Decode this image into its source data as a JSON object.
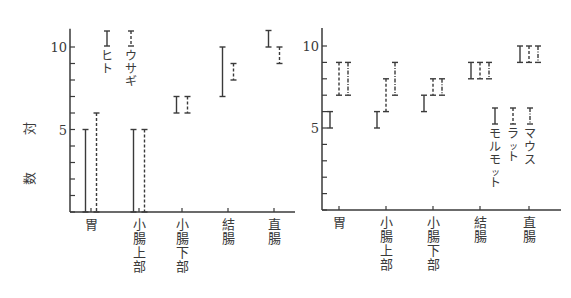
{
  "chart_data": [
    {
      "type": "range",
      "title": "",
      "ylabel": "対数",
      "xlabel": "",
      "ylim": [
        0,
        11
      ],
      "yticks": [
        0,
        1,
        2,
        3,
        4,
        5,
        6,
        7,
        8,
        9,
        10
      ],
      "ytick_labels": {
        "5": "5",
        "10": "10"
      },
      "grid": false,
      "categories": [
        "胃",
        "小腸上部",
        "小腸下部",
        "結腸",
        "直腸"
      ],
      "series": [
        {
          "name": "ヒト",
          "style": "solid",
          "ranges": [
            [
              0,
              5
            ],
            [
              0,
              5
            ],
            [
              6,
              7
            ],
            [
              7,
              10
            ],
            [
              10,
              11
            ]
          ]
        },
        {
          "name": "ウサギ",
          "style": "dashed",
          "ranges": [
            [
              0,
              6
            ],
            [
              0,
              5
            ],
            [
              6,
              7
            ],
            [
              8,
              9
            ],
            [
              9,
              10
            ]
          ]
        }
      ],
      "legend": {
        "position": "inside-top-left",
        "orientation": "vertical-text"
      }
    },
    {
      "type": "range",
      "title": "",
      "ylabel": "",
      "xlabel": "",
      "ylim": [
        0,
        11
      ],
      "yticks": [
        0,
        1,
        2,
        3,
        4,
        5,
        6,
        7,
        8,
        9,
        10
      ],
      "ytick_labels": {
        "5": "5",
        "10": "10"
      },
      "grid": false,
      "categories": [
        "胃",
        "小腸上部",
        "小腸下部",
        "結腸",
        "直腸"
      ],
      "series": [
        {
          "name": "モルモット",
          "style": "solid",
          "ranges": [
            [
              5,
              6
            ],
            [
              5,
              6
            ],
            [
              6,
              7
            ],
            [
              8,
              9
            ],
            [
              9,
              10
            ]
          ]
        },
        {
          "name": "ラット",
          "style": "dashed",
          "ranges": [
            [
              7,
              9
            ],
            [
              6,
              8
            ],
            [
              7,
              8
            ],
            [
              8,
              9
            ],
            [
              9,
              10
            ]
          ]
        },
        {
          "name": "マウス",
          "style": "dashdot",
          "ranges": [
            [
              7,
              9
            ],
            [
              7,
              9
            ],
            [
              7,
              8
            ],
            [
              8,
              9
            ],
            [
              9,
              10
            ]
          ]
        }
      ],
      "legend": {
        "position": "inside-bottom-right",
        "orientation": "vertical-text"
      }
    }
  ]
}
